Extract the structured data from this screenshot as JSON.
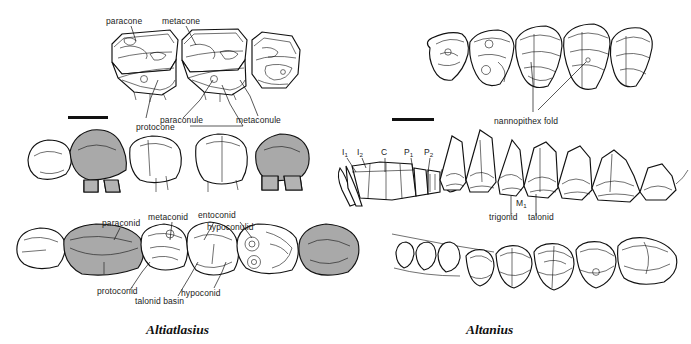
{
  "figure": {
    "type": "scientific-illustration",
    "background_color": "#ffffff",
    "ink_color": "#111111",
    "shade_color": "#a9a9a9"
  },
  "taxa": {
    "left": "Altiatlasius",
    "right": "Altanius"
  },
  "left_panel": {
    "upper_teeth_labels": {
      "paracone": "paracone",
      "metacone": "metacone",
      "paraconule": "paraconule",
      "protocone": "protocone",
      "metaconule": "metaconule"
    },
    "lower_teeth_labels": {
      "paraconid": "paraconid",
      "metaconid": "metaconid",
      "entoconid": "entoconid",
      "hypoconulid": "hypoconulid",
      "protoconid": "protoconid",
      "talonid_basin": "talonid basin",
      "hypoconid": "hypoconid"
    },
    "scale_bar": true
  },
  "right_panel": {
    "labels": {
      "nannopithex_fold": "nannopithex fold",
      "molar": "M",
      "molar_sub": "1",
      "trigonid": "trigonid",
      "talonid": "talonid"
    },
    "jaw_fragment_labels": [
      {
        "base": "I",
        "sub": "1"
      },
      {
        "base": "I",
        "sub": "2"
      },
      {
        "base": "C",
        "sub": ""
      },
      {
        "base": "P",
        "sub": "1"
      },
      {
        "base": "P",
        "sub": "2"
      }
    ],
    "scale_bar": true
  }
}
